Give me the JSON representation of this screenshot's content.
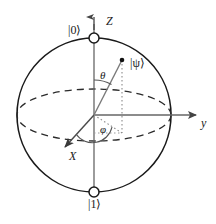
{
  "figure": {
    "stroke_color": "#1a1a1a",
    "axis_color": "#555555",
    "background": "#ffffff"
  },
  "labels": {
    "ket_zero": "|0⟩",
    "ket_one": "|1⟩",
    "ket_psi": "|ψ⟩",
    "axis_z": "Z",
    "axis_y": "y",
    "axis_x": "X",
    "angle_theta": "θ",
    "angle_phi": "φ"
  },
  "icons": {
    "north_pole": "open-circle-marker",
    "south_pole": "open-circle-marker",
    "state_point": "filled-dot-marker",
    "z_arrow": "arrowhead-up",
    "y_arrow": "arrowhead-right",
    "x_arrow": "arrowhead-down-left"
  },
  "geometry": {
    "center_x": 94,
    "center_y": 115,
    "radius": 77,
    "equator_ry": 26,
    "state_point_x": 122,
    "state_point_y": 60,
    "projection_x": 122,
    "projection_y": 132,
    "z_axis_top_y": 18,
    "y_axis_end_x": 198,
    "x_axis_end_x": 63,
    "x_axis_end_y": 149
  }
}
